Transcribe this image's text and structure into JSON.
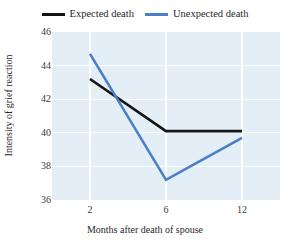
{
  "chart_data": {
    "type": "line",
    "title": "",
    "xlabel": "Months after death of spouse",
    "ylabel": "Intensity of grief reaction",
    "x": [
      2,
      6,
      12
    ],
    "categories": [
      "2",
      "6",
      "12"
    ],
    "xticklabels": [
      "2",
      "6",
      "12"
    ],
    "yticklabels": [
      "36",
      "38",
      "40",
      "42",
      "44",
      "46"
    ],
    "yticks": [
      36,
      38,
      40,
      42,
      44,
      46
    ],
    "ylim": [
      36,
      46
    ],
    "grid": true,
    "grid_color": "#ffffff",
    "plot_background": "#e4eef6",
    "legend_position": "top-center",
    "series": [
      {
        "name": "Expected death",
        "color": "#141414",
        "values": [
          43.2,
          40.1,
          40.1
        ]
      },
      {
        "name": "Unexpected death",
        "color": "#4a7fc8",
        "values": [
          44.7,
          37.2,
          39.7
        ]
      }
    ]
  },
  "legend": {
    "entries": [
      {
        "label": "Expected death",
        "color": "#141414"
      },
      {
        "label": "Unexpected death",
        "color": "#4a7fc8"
      }
    ]
  },
  "axes": {
    "x_title": "Months after death of spouse",
    "y_title": "Intensity of grief reaction"
  }
}
